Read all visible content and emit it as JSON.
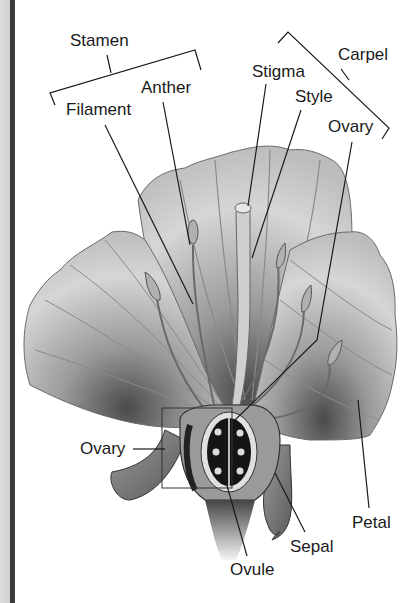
{
  "labels": {
    "stamen": "Stamen",
    "anther": "Anther",
    "filament": "Filament",
    "stigma": "Stigma",
    "carpel": "Carpel",
    "style": "Style",
    "ovary_top": "Ovary",
    "ovary_left": "Ovary",
    "petal": "Petal",
    "sepal": "Sepal",
    "ovule": "Ovule"
  },
  "groups": {
    "stamen": [
      "Anther",
      "Filament"
    ],
    "carpel": [
      "Stigma",
      "Style",
      "Ovary"
    ]
  },
  "colors": {
    "line": "#1a1a1a",
    "petal_light": "#e6e6e6",
    "petal_mid": "#b8b8b8",
    "petal_dark": "#5a5a5a",
    "border_bar": "#3a3a3a"
  }
}
